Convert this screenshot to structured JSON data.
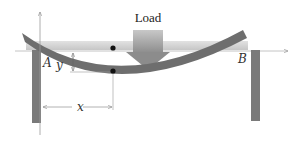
{
  "diagram": {
    "labels": {
      "load": "Load",
      "point_a": "A",
      "point_b": "B",
      "deflection": "y",
      "distance": "x"
    },
    "colors": {
      "beam": "#6e6e6e",
      "undeflected_beam": "#d4d4d4",
      "posts": "#7a7a7a",
      "load_arrow": "#b0b0b0",
      "axis_lines": "#9a9a9a",
      "dots": "#111111"
    }
  }
}
